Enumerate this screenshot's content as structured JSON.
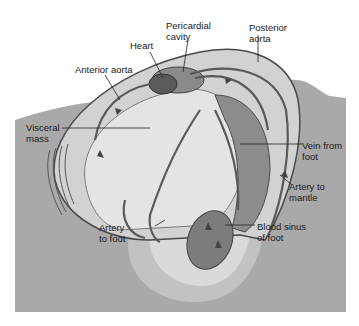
{
  "figure": {
    "colors": {
      "background": "#ffffff",
      "sediment": "#a9a9a9",
      "shell_outline": "#4a4a4a",
      "mantle": "#d2d2d2",
      "visceral": "#e4e4e4",
      "foot_outer": "#c2c2c2",
      "foot_inner": "#dadada",
      "heart": "#6e6e6e",
      "vessel": "#5a5a5a",
      "gill": "#8c8c8c"
    },
    "labels": [
      {
        "id": "heart",
        "text": "Heart"
      },
      {
        "id": "pericardial-cavity",
        "text": "Pericardial\ncavity"
      },
      {
        "id": "posterior-aorta",
        "text": "Posterior\naorta"
      },
      {
        "id": "anterior-aorta",
        "text": "Anterior aorta"
      },
      {
        "id": "visceral-mass",
        "text": "Visceral\nmass"
      },
      {
        "id": "vein-from-foot",
        "text": "Vein from\nfoot"
      },
      {
        "id": "artery-to-mantle",
        "text": "Artery to\nmantle"
      },
      {
        "id": "artery-to-foot",
        "text": "Artery\nto foot"
      },
      {
        "id": "blood-sinus-of-foot",
        "text": "Blood sinus\nof foot"
      }
    ]
  }
}
